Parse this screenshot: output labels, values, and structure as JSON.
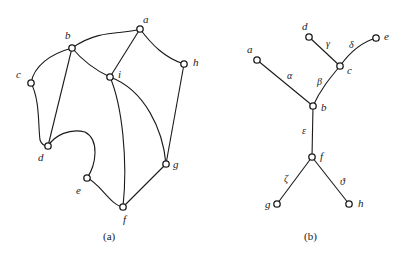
{
  "figure": {
    "colors": {
      "ink": "#1a1a1a",
      "background": "#ffffff",
      "node_fill": "#ffffff"
    },
    "panel_a": {
      "caption": "(a)",
      "nodes": {
        "a": {
          "label": "a",
          "x": 140,
          "y": 29
        },
        "b": {
          "label": "b",
          "x": 72,
          "y": 48
        },
        "c": {
          "label": "c",
          "x": 31,
          "y": 83
        },
        "d": {
          "label": "d",
          "x": 48,
          "y": 146
        },
        "e": {
          "label": "e",
          "x": 87,
          "y": 178
        },
        "f": {
          "label": "f",
          "x": 123,
          "y": 207
        },
        "g": {
          "label": "g",
          "x": 166,
          "y": 164
        },
        "h": {
          "label": "h",
          "x": 184,
          "y": 64
        },
        "i": {
          "label": "i",
          "x": 110,
          "y": 77
        }
      },
      "edges": [
        [
          "a",
          "b"
        ],
        [
          "a",
          "i"
        ],
        [
          "a",
          "h"
        ],
        [
          "b",
          "c"
        ],
        [
          "b",
          "i"
        ],
        [
          "b",
          "d"
        ],
        [
          "c",
          "d"
        ],
        [
          "d",
          "e"
        ],
        [
          "e",
          "f"
        ],
        [
          "i",
          "f"
        ],
        [
          "i",
          "g"
        ],
        [
          "h",
          "g"
        ],
        [
          "f",
          "g"
        ]
      ]
    },
    "panel_b": {
      "caption": "(b)",
      "nodes": {
        "a": {
          "label": "a",
          "x": 257,
          "y": 60
        },
        "b": {
          "label": "b",
          "x": 313,
          "y": 106
        },
        "c": {
          "label": "c",
          "x": 340,
          "y": 66
        },
        "d": {
          "label": "d",
          "x": 309,
          "y": 37
        },
        "e": {
          "label": "e",
          "x": 376,
          "y": 38
        },
        "f": {
          "label": "f",
          "x": 312,
          "y": 157
        },
        "g": {
          "label": "g",
          "x": 277,
          "y": 204
        },
        "h": {
          "label": "h",
          "x": 349,
          "y": 204
        }
      },
      "edges": [
        {
          "from": "a",
          "to": "b",
          "label": "α"
        },
        {
          "from": "b",
          "to": "c",
          "label": "β"
        },
        {
          "from": "d",
          "to": "c",
          "label": "γ"
        },
        {
          "from": "c",
          "to": "e",
          "label": "δ"
        },
        {
          "from": "b",
          "to": "f",
          "label": "ε"
        },
        {
          "from": "f",
          "to": "g",
          "label": "ζ"
        },
        {
          "from": "f",
          "to": "h",
          "label": "ϑ"
        }
      ]
    }
  }
}
